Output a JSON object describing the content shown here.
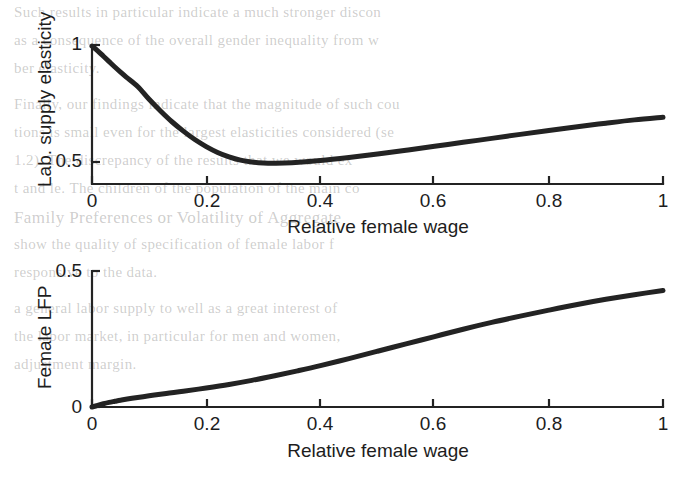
{
  "figure": {
    "background_color": "#ffffff",
    "line_color": "#232323",
    "panels": [
      {
        "id": "top",
        "ylabel": "Lab. supply elasticity",
        "xlabel": "Relative female wage",
        "xticks": [
          "0",
          "0.2",
          "0.4",
          "0.6",
          "0.8",
          "1"
        ],
        "yticks": [
          "0.5",
          "1"
        ]
      },
      {
        "id": "bottom",
        "ylabel": "Female LFP",
        "xlabel": "Relative female wage",
        "xticks": [
          "0",
          "0.2",
          "0.4",
          "0.6",
          "0.8",
          "1"
        ],
        "yticks": [
          "0",
          "0.5"
        ]
      }
    ]
  },
  "chart_data": [
    {
      "type": "line",
      "id": "labor-supply-elasticity",
      "title": "",
      "xlabel": "Relative female wage",
      "ylabel": "Lab. supply elasticity",
      "xlim": [
        0,
        1
      ],
      "ylim": [
        0.41,
        1.09
      ],
      "xticks": [
        0,
        0.2,
        0.4,
        0.6,
        0.8,
        1
      ],
      "xticklabels": [
        "0",
        "0.2",
        "0.4",
        "0.6",
        "0.8",
        "1"
      ],
      "yticks": [
        0.5,
        1
      ],
      "yticklabels": [
        "0.5",
        "1"
      ],
      "grid": false,
      "legend": null,
      "series": [
        {
          "name": "Labor supply elasticity",
          "color": "#232323",
          "linewidth": 4,
          "x": [
            0,
            0.01,
            0.02,
            0.03,
            0.04,
            0.05,
            0.06,
            0.08,
            0.1,
            0.12,
            0.14,
            0.16,
            0.18,
            0.2,
            0.22,
            0.24,
            0.26,
            0.28,
            0.3,
            0.32,
            0.35,
            0.4,
            0.45,
            0.5,
            0.55,
            0.6,
            0.65,
            0.7,
            0.75,
            0.8,
            0.85,
            0.9,
            0.95,
            1
          ],
          "y": [
            0.995,
            0.975,
            0.952,
            0.929,
            0.906,
            0.884,
            0.863,
            0.823,
            0.768,
            0.718,
            0.672,
            0.632,
            0.596,
            0.566,
            0.541,
            0.522,
            0.508,
            0.5,
            0.496,
            0.495,
            0.497,
            0.506,
            0.519,
            0.534,
            0.55,
            0.567,
            0.584,
            0.601,
            0.618,
            0.635,
            0.651,
            0.666,
            0.68,
            0.691
          ]
        }
      ]
    },
    {
      "type": "line",
      "id": "female-lfp",
      "title": "",
      "xlabel": "Relative female wage",
      "ylabel": "Female LFP",
      "xlim": [
        0,
        1
      ],
      "ylim": [
        0,
        0.5
      ],
      "xticks": [
        0,
        0.2,
        0.4,
        0.6,
        0.8,
        1
      ],
      "xticklabels": [
        "0",
        "0.2",
        "0.4",
        "0.6",
        "0.8",
        "1"
      ],
      "yticks": [
        0,
        0.5
      ],
      "yticklabels": [
        "0",
        "0.5"
      ],
      "grid": false,
      "legend": null,
      "series": [
        {
          "name": "Female labor force participation",
          "color": "#232323",
          "linewidth": 4,
          "x": [
            0,
            0.01,
            0.02,
            0.03,
            0.04,
            0.05,
            0.07,
            0.1,
            0.13,
            0.16,
            0.2,
            0.24,
            0.28,
            0.32,
            0.36,
            0.4,
            0.45,
            0.5,
            0.55,
            0.6,
            0.65,
            0.7,
            0.75,
            0.8,
            0.85,
            0.9,
            0.95,
            1
          ],
          "y": [
            0.0,
            0.006,
            0.012,
            0.017,
            0.021,
            0.025,
            0.032,
            0.041,
            0.05,
            0.058,
            0.07,
            0.083,
            0.098,
            0.115,
            0.133,
            0.152,
            0.178,
            0.205,
            0.232,
            0.259,
            0.286,
            0.311,
            0.334,
            0.356,
            0.377,
            0.396,
            0.413,
            0.428
          ]
        }
      ]
    }
  ],
  "bleed_text": [
    {
      "text": "Such results in particular indicate a much stronger discon",
      "x": 14,
      "y": 4,
      "size": 15
    },
    {
      "text": "as a consequence of the overall gender inequality from w",
      "x": 14,
      "y": 32,
      "size": 15
    },
    {
      "text": "ber elasticity.",
      "x": 14,
      "y": 60,
      "size": 15
    },
    {
      "text": "Finally, our findings indicate that the magnitude of such cou",
      "x": 14,
      "y": 96,
      "size": 15
    },
    {
      "text": "tions is small even for the largest elasticities considered (se",
      "x": 14,
      "y": 124,
      "size": 15
    },
    {
      "text": "1.2). The discrepancy of the results that we would ex",
      "x": 14,
      "y": 152,
      "size": 15
    },
    {
      "text": "t and le. The children of the population of the main co",
      "x": 14,
      "y": 180,
      "size": 15
    },
    {
      "text": "Family Preferences or Volatility of Aggregate",
      "x": 14,
      "y": 208,
      "size": 17
    },
    {
      "text": "show the quality of specification of female labor f",
      "x": 14,
      "y": 236,
      "size": 15
    },
    {
      "text": "responsive to the data.",
      "x": 14,
      "y": 264,
      "size": 15
    },
    {
      "text": "a general labor supply to well as a great interest of",
      "x": 14,
      "y": 300,
      "size": 15
    },
    {
      "text": "the labor market, in particular for men and women,",
      "x": 14,
      "y": 328,
      "size": 15
    },
    {
      "text": "adjustment margin.",
      "x": 14,
      "y": 356,
      "size": 15
    }
  ]
}
